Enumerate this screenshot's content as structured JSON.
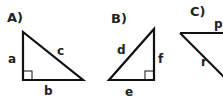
{
  "triangles": [
    {
      "label": "A)",
      "sides": {
        "vertical": "a",
        "hypotenuse": "c",
        "bottom": "b"
      }
    },
    {
      "label": "B)",
      "sides": {
        "hypotenuse": "d",
        "vertical": "f",
        "bottom": "e"
      }
    },
    {
      "label": "C)",
      "sides": {
        "top": "p",
        "diagonal": "r"
      }
    }
  ],
  "colors": {
    "stroke": "#111111",
    "text": "#222222"
  }
}
